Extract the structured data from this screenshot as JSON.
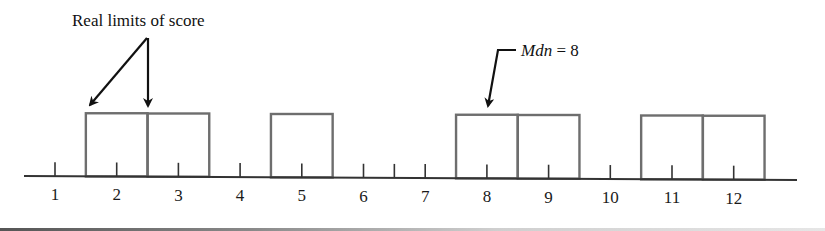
{
  "figure": {
    "annotations": {
      "real_limits": {
        "text": "Real limits of score",
        "targets": [
          "left real limit of score 2 (1.5)",
          "upper real limit of score 2 / lower of 3 (2.5)"
        ]
      },
      "median": {
        "label_italic": "Mdn",
        "label_rest": " = 8",
        "target_score": 8
      }
    },
    "axis": {
      "tick_labels": [
        "1",
        "2",
        "3",
        "4",
        "5",
        "6",
        "7",
        "8",
        "9",
        "10",
        "11",
        "12"
      ],
      "extra_tick_between": [
        6,
        7
      ]
    },
    "colors": {
      "box_stroke": "#6e6e6e",
      "axis": "#333333",
      "arrow": "#111111",
      "text": "#111111"
    }
  },
  "chart_data": {
    "type": "bar",
    "title": "",
    "xlabel": "",
    "ylabel": "",
    "categories": [
      "1",
      "2",
      "3",
      "4",
      "5",
      "6",
      "7",
      "8",
      "9",
      "10",
      "11",
      "12"
    ],
    "values": [
      0,
      1,
      1,
      0,
      1,
      0,
      0,
      1,
      1,
      0,
      1,
      1
    ],
    "scores_present": [
      2,
      3,
      5,
      8,
      9,
      11,
      12
    ],
    "bar_width_units": 1,
    "real_limits_example": [
      1.5,
      2.5
    ],
    "median": 8,
    "annotations": [
      "Real limits of score",
      "Mdn = 8"
    ],
    "grid": false,
    "legend": "none"
  }
}
